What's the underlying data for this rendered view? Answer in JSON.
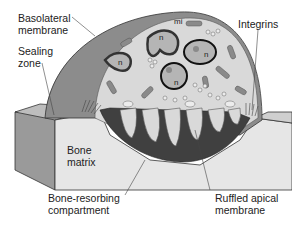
{
  "diagram": {
    "labels": {
      "basolateral_membrane": "Basolateral\nmembrane",
      "basolateral_line1": "Basolateral",
      "basolateral_line2": "membrane",
      "sealing_line1": "Sealing",
      "sealing_line2": "zone",
      "integrins": "Integrins",
      "bone_line1": "Bone",
      "bone_line2": "matrix",
      "compartment_line1": "Bone-resorbing",
      "compartment_line2": "compartment",
      "ruffled_line1": "Ruffled apical",
      "ruffled_line2": "membrane"
    },
    "organelle_labels": {
      "mitochondrion": "mi",
      "nucleus_1": "n",
      "nucleus_2": "n",
      "nucleus_3": "n",
      "nucleus_4": "n"
    },
    "colors": {
      "outer_cell": "#8c8c8c",
      "cytoplasm": "#d9d9d9",
      "bone_top": "#e6e6e6",
      "bone_side": "#9a9a9a",
      "resorbing_compartment": "#404040",
      "nucleus_fill": "#b5b5b5",
      "nucleus_ring": "#111111",
      "organelle": "#8a8a8a"
    }
  }
}
